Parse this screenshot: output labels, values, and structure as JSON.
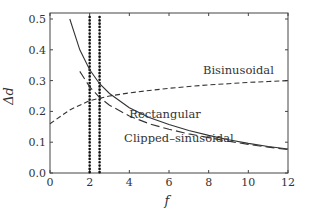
{
  "chart_data": {
    "type": "line",
    "title": "",
    "xlabel": "f",
    "ylabel": "Δd",
    "xlim": [
      0,
      12
    ],
    "ylim": [
      0,
      0.52
    ],
    "xticks": [
      0,
      2,
      4,
      6,
      8,
      10,
      12
    ],
    "xtick_labels": [
      "0",
      "2",
      "4",
      "6",
      "8",
      "10",
      "12"
    ],
    "yticks": [
      0.0,
      0.1,
      0.2,
      0.3,
      0.4,
      0.5
    ],
    "ytick_labels": [
      "0.0",
      "0.1",
      "0.2",
      "0.3",
      "0.4",
      "0.5"
    ],
    "grid": false,
    "legend": "inline annotations",
    "series": [
      {
        "name": "Rectangular",
        "style": "solid",
        "x": [
          1,
          1.5,
          2,
          2.5,
          3,
          4,
          5,
          6,
          7,
          8,
          9,
          10,
          11,
          12
        ],
        "y": [
          0.5,
          0.4,
          0.335,
          0.29,
          0.258,
          0.212,
          0.18,
          0.157,
          0.138,
          0.122,
          0.108,
          0.096,
          0.086,
          0.078
        ]
      },
      {
        "name": "Clipped-sinusoidal",
        "style": "long-dash",
        "x": [
          1.5,
          2,
          2.5,
          3,
          4,
          5,
          6,
          7,
          8,
          9,
          10,
          11,
          12
        ],
        "y": [
          0.33,
          0.28,
          0.245,
          0.22,
          0.185,
          0.16,
          0.142,
          0.127,
          0.115,
          0.103,
          0.093,
          0.084,
          0.076
        ]
      },
      {
        "name": "Bisinusoidal",
        "style": "short-dash",
        "x": [
          0,
          1,
          2,
          3,
          4,
          5,
          6,
          7,
          8,
          9,
          10,
          11,
          12
        ],
        "y": [
          0.16,
          0.205,
          0.235,
          0.25,
          0.26,
          0.268,
          0.275,
          0.281,
          0.286,
          0.29,
          0.294,
          0.297,
          0.3
        ]
      }
    ],
    "vertical_lines": [
      {
        "x": 2.0,
        "style": "dotted"
      },
      {
        "x": 2.5,
        "style": "dotted"
      }
    ],
    "annotations": [
      {
        "text": "Bisinusoidal",
        "x": 9.5,
        "y": 0.32
      },
      {
        "text": "Rectangular",
        "x": 5.8,
        "y": 0.18
      },
      {
        "text": "Clipped–sinusoidal",
        "x": 6.5,
        "y": 0.1
      }
    ]
  }
}
